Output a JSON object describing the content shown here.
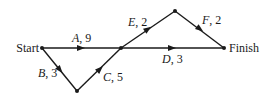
{
  "diagram": {
    "type": "activity-network",
    "nodes": [
      {
        "id": "start",
        "label": "Start",
        "x": 42,
        "y": 48
      },
      {
        "id": "n1",
        "label": "",
        "x": 77,
        "y": 91
      },
      {
        "id": "n2",
        "label": "",
        "x": 121,
        "y": 48
      },
      {
        "id": "n3",
        "label": "",
        "x": 175,
        "y": 11
      },
      {
        "id": "finish",
        "label": "Finish",
        "x": 224,
        "y": 48
      }
    ],
    "edges": [
      {
        "from": "start",
        "to": "n2",
        "activity": "A",
        "duration": "9"
      },
      {
        "from": "start",
        "to": "n1",
        "activity": "B",
        "duration": "3"
      },
      {
        "from": "n1",
        "to": "n2",
        "activity": "C",
        "duration": "5"
      },
      {
        "from": "n2",
        "to": "finish",
        "activity": "D",
        "duration": "3"
      },
      {
        "from": "n2",
        "to": "n3",
        "activity": "E",
        "duration": "2"
      },
      {
        "from": "n3",
        "to": "finish",
        "activity": "F",
        "duration": "2"
      }
    ]
  },
  "labels": {
    "start": "Start",
    "finish": "Finish",
    "A": "A",
    "A_dur": ", 9",
    "B": "B",
    "B_dur": ", 3",
    "C": "C",
    "C_dur": ", 5",
    "D": "D",
    "D_dur": ", 3",
    "E": "E",
    "E_dur": ", 2",
    "F": "F",
    "F_dur": ", 2"
  }
}
